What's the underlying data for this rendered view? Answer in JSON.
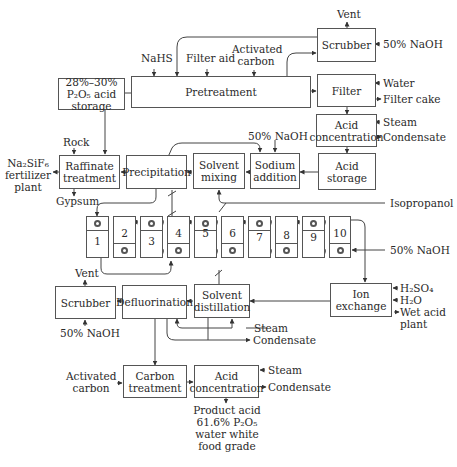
{
  "boxes": {
    "acid_storage_feed": "28%–30% P₂O₅ acid storage",
    "pretreatment": "Pretreatment",
    "scrubber_top": "Scrubber",
    "filter": "Filter",
    "acid_concentration_top": "Acid concentration",
    "acid_storage": "Acid storage",
    "sodium_addition": "Sodium addition",
    "solvent_mixing": "Solvent mixing",
    "precipitation": "Precipitation",
    "raffinate_treatment": "Raffinate treatment",
    "ion_exchange": "Ion exchange",
    "solvent_distillation": "Solvent distillation",
    "defluorination": "Defluorination",
    "scrubber_bottom": "Scrubber",
    "carbon_treatment": "Carbon treatment",
    "acid_concentration_bottom": "Acid concentration"
  },
  "streams": {
    "vent_top": "Vent",
    "naoh_top": "50% NaOH",
    "nahs": "NaHS",
    "filter_aid": "Filter aid",
    "activated_carbon_top": "Activated carbon",
    "water": "Water",
    "filter_cake": "Filter cake",
    "steam_top": "Steam",
    "condensate_top": "Condensate",
    "naoh_sodium": "50% NaOH",
    "rock": "Rock",
    "na2sif6": "Na₂SiF₆ fertilizer plant",
    "gypsum": "Gypsum",
    "isopropanol": "Isopropanol",
    "naoh_columns": "50% NaOH",
    "h2so4": "H₂SO₄",
    "h2o": "H₂O",
    "wet_acid_plant": "Wet acid plant",
    "vent_bottom": "Vent",
    "naoh_bottom": "50% NaOH",
    "steam_mid": "Steam",
    "condensate_mid": "Condensate",
    "activated_carbon_bottom": "Activated carbon",
    "steam_bottom": "Steam",
    "condensate_bottom": "Condensate",
    "product": "Product acid 61.6% P₂O₅ water white food grade"
  },
  "columns": [
    {
      "num": "1",
      "pump": "top"
    },
    {
      "num": "2",
      "pump": "bottom"
    },
    {
      "num": "3",
      "pump": "top"
    },
    {
      "num": "4",
      "pump": "bottom"
    },
    {
      "num": "5",
      "pump": "top"
    },
    {
      "num": "6",
      "pump": "bottom"
    },
    {
      "num": "7",
      "pump": "top"
    },
    {
      "num": "8",
      "pump": "bottom"
    },
    {
      "num": "9",
      "pump": "top"
    },
    {
      "num": "10",
      "pump": "bottom"
    }
  ]
}
